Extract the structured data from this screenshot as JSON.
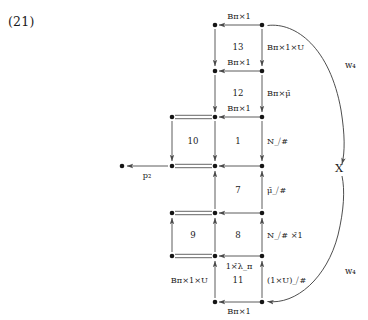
{
  "equation": {
    "number": "(21)"
  },
  "diagram": {
    "type": "commutative-diagram",
    "colors": {
      "node": "#151515",
      "arrow": "#4a4a4a",
      "arc": "#3a3a3a",
      "text": "#1a1a1a",
      "background": "#ffffff"
    },
    "columns": {
      "far_left": {
        "name": "column-far-left",
        "x": 122
      },
      "left": {
        "name": "column-left",
        "x": 172
      },
      "center": {
        "name": "column-center",
        "x": 215
      },
      "right": {
        "name": "column-right",
        "x": 262
      }
    },
    "rows": [
      {
        "name": "row-1",
        "y": 25
      },
      {
        "name": "row-2",
        "y": 71
      },
      {
        "name": "row-3",
        "y": 117
      },
      {
        "name": "row-4",
        "y": 166
      },
      {
        "name": "row-5",
        "y": 213
      },
      {
        "name": "row-6",
        "y": 256
      },
      {
        "name": "row-7",
        "y": 302
      }
    ],
    "cells": [
      {
        "id": "cell-13",
        "label": "13"
      },
      {
        "id": "cell-12",
        "label": "12"
      },
      {
        "id": "cell-10",
        "label": "10"
      },
      {
        "id": "cell-1",
        "label": "1"
      },
      {
        "id": "cell-7",
        "label": "7"
      },
      {
        "id": "cell-9",
        "label": "9"
      },
      {
        "id": "cell-8",
        "label": "8"
      },
      {
        "id": "cell-11",
        "label": "11"
      }
    ],
    "horizontal_labels": {
      "row1_center": "Bπ×1",
      "row2_center": "Bπ×1",
      "row3_center": "Bπ×1",
      "row4_far_left": "p₂",
      "row7_center": "Bπ×1",
      "row6_center": "1×̄λ_π"
    },
    "vertical_labels": {
      "row1_row2_right": "Bπ×1×U",
      "row2_row3_right": "Bπ×μ̄",
      "row3_row4_right": "N_⧸#",
      "row4_row5_right": "μ̄_⧸#",
      "row5_row6_right": "N_⧸# ×̄1",
      "row6_row7_right": "(1×U)_⧸#",
      "row6_row7_left": "Bπ×1×U"
    },
    "arc_labels": {
      "top": "w₄",
      "middle": "X",
      "bottom": "w₄"
    }
  }
}
